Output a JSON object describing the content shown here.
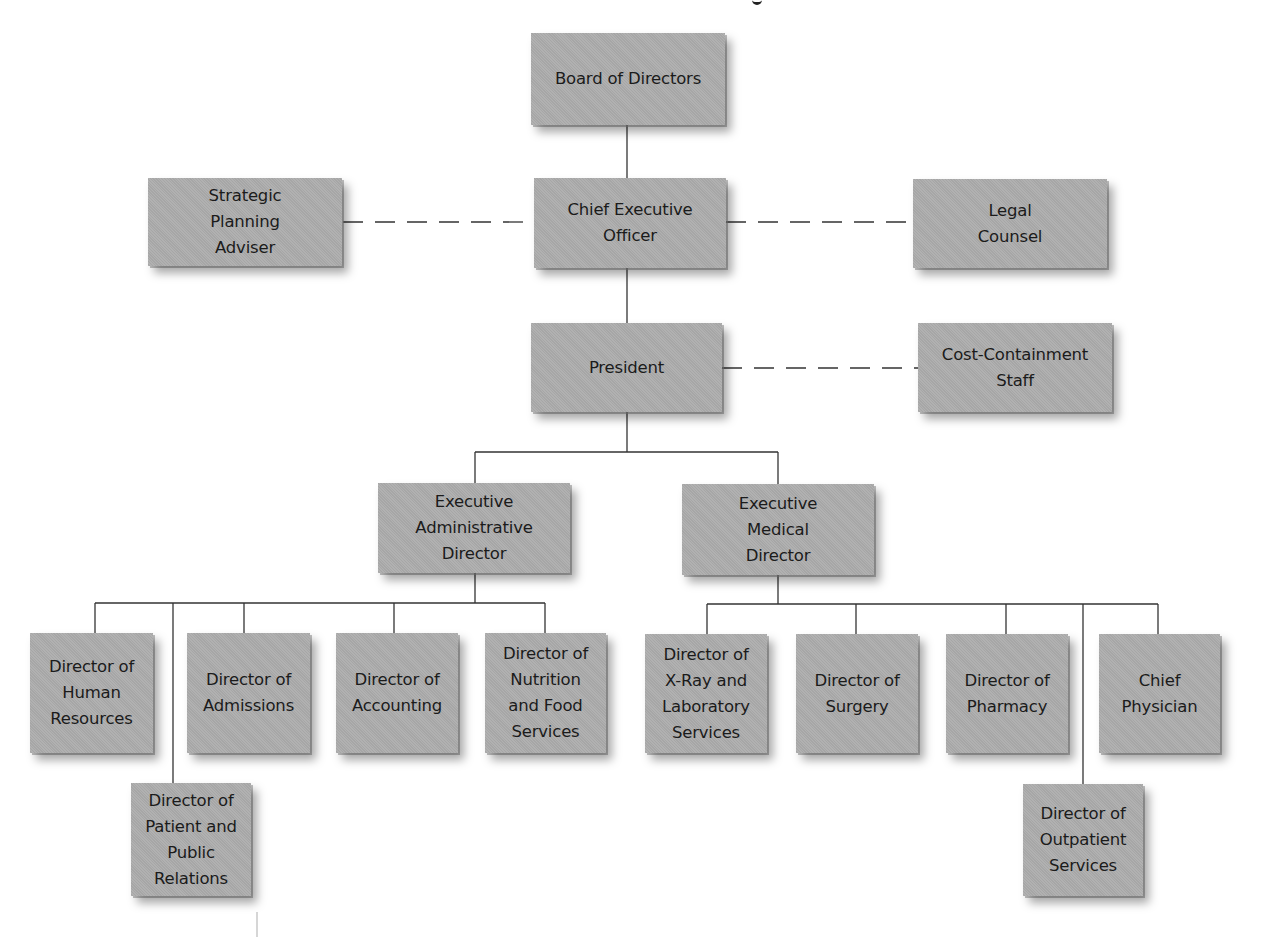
{
  "diagram": {
    "type": "organizational-chart",
    "title_fragment": "y",
    "nodes": {
      "board": {
        "label": "Board of Directors"
      },
      "ceo": {
        "label": "Chief Executive\nOfficer"
      },
      "strategic": {
        "label": "Strategic\nPlanning\nAdviser"
      },
      "legal": {
        "label": "Legal\nCounsel"
      },
      "president": {
        "label": "President"
      },
      "cost": {
        "label": "Cost-Containment\nStaff"
      },
      "exec_admin": {
        "label": "Executive\nAdministrative\nDirector"
      },
      "exec_medical": {
        "label": "Executive\nMedical\nDirector"
      },
      "hr": {
        "label": "Director of\nHuman\nResources"
      },
      "patient_pr": {
        "label": "Director of\nPatient and\nPublic\nRelations"
      },
      "admissions": {
        "label": "Director of\nAdmissions"
      },
      "accounting": {
        "label": "Director of\nAccounting"
      },
      "nutrition": {
        "label": "Director of\nNutrition\nand Food\nServices"
      },
      "xray": {
        "label": "Director of\nX-Ray and\nLaboratory\nServices"
      },
      "surgery": {
        "label": "Director of\nSurgery"
      },
      "pharmacy": {
        "label": "Director of\nPharmacy"
      },
      "physician": {
        "label": "Chief\nPhysician"
      },
      "outpatient": {
        "label": "Director of\nOutpatient\nServices"
      }
    },
    "edges": [
      {
        "from": "board",
        "to": "ceo",
        "style": "solid"
      },
      {
        "from": "ceo",
        "to": "strategic",
        "style": "dashed"
      },
      {
        "from": "ceo",
        "to": "legal",
        "style": "dashed"
      },
      {
        "from": "ceo",
        "to": "president",
        "style": "solid"
      },
      {
        "from": "president",
        "to": "cost",
        "style": "dashed"
      },
      {
        "from": "president",
        "to": "exec_admin",
        "style": "solid"
      },
      {
        "from": "president",
        "to": "exec_medical",
        "style": "solid"
      },
      {
        "from": "exec_admin",
        "to": "hr",
        "style": "solid"
      },
      {
        "from": "exec_admin",
        "to": "patient_pr",
        "style": "solid"
      },
      {
        "from": "exec_admin",
        "to": "admissions",
        "style": "solid"
      },
      {
        "from": "exec_admin",
        "to": "accounting",
        "style": "solid"
      },
      {
        "from": "exec_admin",
        "to": "nutrition",
        "style": "solid"
      },
      {
        "from": "exec_medical",
        "to": "xray",
        "style": "solid"
      },
      {
        "from": "exec_medical",
        "to": "surgery",
        "style": "solid"
      },
      {
        "from": "exec_medical",
        "to": "pharmacy",
        "style": "solid"
      },
      {
        "from": "exec_medical",
        "to": "outpatient",
        "style": "solid"
      },
      {
        "from": "exec_medical",
        "to": "physician",
        "style": "solid"
      }
    ],
    "colors": {
      "box_fill": "#adadad",
      "text": "#1b1b1b",
      "line": "#333333",
      "background": "#ffffff"
    }
  }
}
